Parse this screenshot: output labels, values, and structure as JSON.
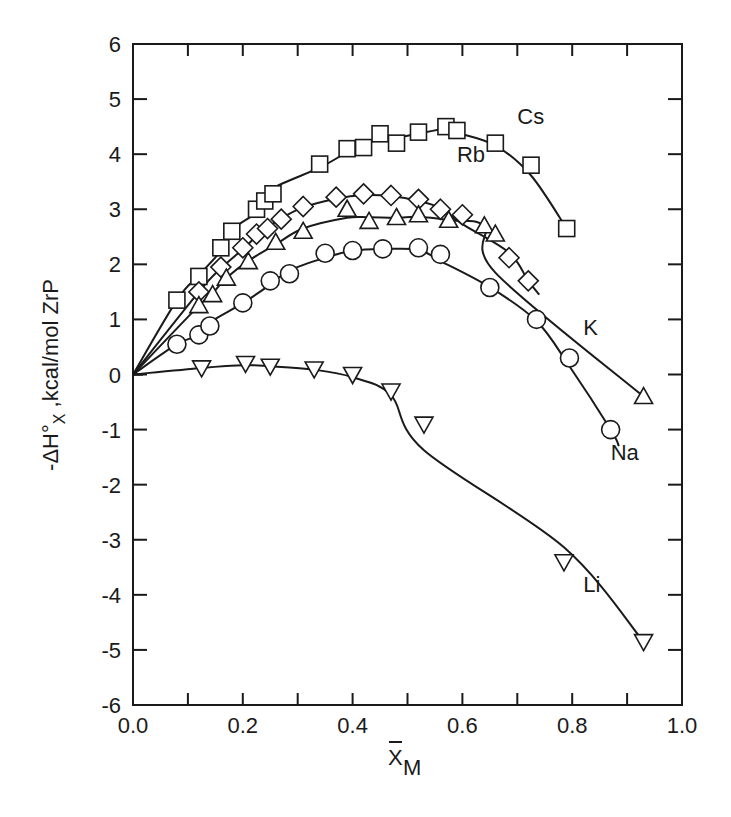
{
  "chart_data": {
    "type": "line",
    "title": "",
    "xlabel": "X̄_M",
    "ylabel": "-ΔH°_X , kcal/mol ZrP",
    "xlim": [
      0.0,
      1.0
    ],
    "ylim": [
      -6,
      6
    ],
    "grid": false,
    "legend": "inline labels at curve ends",
    "x_ticks": [
      "0.0",
      "0.2",
      "0.4",
      "0.6",
      "0.8",
      "1.0"
    ],
    "y_ticks": [
      "-6",
      "-5",
      "-4",
      "-3",
      "-2",
      "-1",
      "0",
      "1",
      "2",
      "3",
      "4",
      "5",
      "6"
    ],
    "series": [
      {
        "name": "Cs",
        "marker": "square",
        "points": [
          [
            0.08,
            1.35
          ],
          [
            0.12,
            1.78
          ],
          [
            0.16,
            2.3
          ],
          [
            0.18,
            2.6
          ],
          [
            0.225,
            3.0
          ],
          [
            0.24,
            3.15
          ],
          [
            0.255,
            3.28
          ],
          [
            0.34,
            3.82
          ],
          [
            0.39,
            4.1
          ],
          [
            0.42,
            4.12
          ],
          [
            0.45,
            4.37
          ],
          [
            0.48,
            4.2
          ],
          [
            0.52,
            4.4
          ],
          [
            0.57,
            4.5
          ],
          [
            0.59,
            4.43
          ],
          [
            0.66,
            4.2
          ],
          [
            0.725,
            3.8
          ],
          [
            0.79,
            2.65
          ]
        ],
        "label_pos": [
          0.7,
          4.55
        ]
      },
      {
        "name": "Rb",
        "marker": "diamond",
        "points": [
          [
            0.12,
            1.5
          ],
          [
            0.16,
            1.95
          ],
          [
            0.2,
            2.3
          ],
          [
            0.225,
            2.55
          ],
          [
            0.245,
            2.65
          ],
          [
            0.27,
            2.82
          ],
          [
            0.31,
            3.05
          ],
          [
            0.37,
            3.22
          ],
          [
            0.42,
            3.28
          ],
          [
            0.47,
            3.25
          ],
          [
            0.52,
            3.18
          ],
          [
            0.56,
            3.0
          ],
          [
            0.6,
            2.9
          ],
          [
            0.685,
            2.12
          ],
          [
            0.72,
            1.7
          ]
        ],
        "curve_end": [
          0.74,
          1.45
        ],
        "label_pos": [
          0.59,
          3.85
        ]
      },
      {
        "name": "K",
        "marker": "triangle-up",
        "points": [
          [
            0.12,
            1.25
          ],
          [
            0.145,
            1.45
          ],
          [
            0.17,
            1.75
          ],
          [
            0.21,
            2.05
          ],
          [
            0.26,
            2.4
          ],
          [
            0.31,
            2.6
          ],
          [
            0.39,
            3.0
          ],
          [
            0.43,
            2.78
          ],
          [
            0.48,
            2.85
          ],
          [
            0.52,
            2.9
          ],
          [
            0.575,
            2.8
          ],
          [
            0.64,
            2.7
          ],
          [
            0.66,
            2.55
          ],
          [
            0.93,
            -0.4
          ]
        ],
        "label_pos": [
          0.82,
          0.72
        ]
      },
      {
        "name": "Na",
        "marker": "circle",
        "points": [
          [
            0.08,
            0.55
          ],
          [
            0.12,
            0.72
          ],
          [
            0.14,
            0.88
          ],
          [
            0.2,
            1.3
          ],
          [
            0.25,
            1.7
          ],
          [
            0.285,
            1.83
          ],
          [
            0.35,
            2.2
          ],
          [
            0.4,
            2.25
          ],
          [
            0.455,
            2.28
          ],
          [
            0.52,
            2.3
          ],
          [
            0.56,
            2.18
          ],
          [
            0.65,
            1.58
          ],
          [
            0.735,
            1.0
          ],
          [
            0.795,
            0.3
          ],
          [
            0.87,
            -1.0
          ]
        ],
        "curve_end": [
          0.885,
          -1.3
        ],
        "label_pos": [
          0.87,
          -1.55
        ]
      },
      {
        "name": "Li",
        "marker": "triangle-down",
        "points": [
          [
            0.125,
            0.12
          ],
          [
            0.205,
            0.2
          ],
          [
            0.25,
            0.15
          ],
          [
            0.33,
            0.1
          ],
          [
            0.4,
            0.0
          ],
          [
            0.47,
            -0.3
          ],
          [
            0.53,
            -0.9
          ],
          [
            0.785,
            -3.4
          ],
          [
            0.93,
            -4.85
          ]
        ],
        "label_pos": [
          0.82,
          -3.95
        ]
      }
    ]
  },
  "axes": {
    "x_title_main": "X",
    "x_title_sub": "M",
    "y_title_main": "-ΔH°",
    "y_title_sub": "X",
    "y_title_rest": " ,kcal/mol ZrP"
  }
}
